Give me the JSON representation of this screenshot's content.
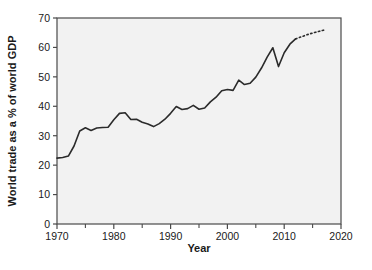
{
  "chart_data": {
    "type": "line",
    "title": "",
    "xlabel": "Year",
    "ylabel": "World trade as a % of world GDP",
    "xlim": [
      1970,
      2020
    ],
    "ylim": [
      0,
      70
    ],
    "xticks": [
      1970,
      1980,
      1990,
      2000,
      2010,
      2020
    ],
    "xtick_labels": [
      "1970",
      "1980",
      "1990",
      "2000",
      "2010",
      "2020"
    ],
    "xminor_ticks": [
      1975,
      1985,
      1995,
      2005,
      2015
    ],
    "yticks": [
      0,
      10,
      20,
      30,
      40,
      50,
      60,
      70
    ],
    "ytick_labels": [
      "0",
      "10",
      "20",
      "30",
      "40",
      "50",
      "60",
      "70"
    ],
    "grid": false,
    "legend": null,
    "line_color": "#2b2b2b",
    "plot_background": "#f2f2f2",
    "series": [
      {
        "name": "World trade as a % of world GDP",
        "style": "solid",
        "x": [
          1970,
          1971,
          1972,
          1973,
          1974,
          1975,
          1976,
          1977,
          1978,
          1979,
          1980,
          1981,
          1982,
          1983,
          1984,
          1985,
          1986,
          1987,
          1988,
          1989,
          1990,
          1991,
          1992,
          1993,
          1994,
          1995,
          1996,
          1997,
          1998,
          1999,
          2000,
          2001,
          2002,
          2003,
          2004,
          2005,
          2006,
          2007,
          2008,
          2009,
          2010,
          2011,
          2012
        ],
        "values": [
          22.4,
          22.6,
          23.1,
          26.5,
          31.6,
          32.7,
          31.8,
          32.6,
          32.8,
          32.9,
          35.4,
          37.6,
          37.8,
          35.5,
          35.6,
          34.6,
          34.0,
          33.1,
          34.1,
          35.6,
          37.6,
          39.9,
          38.9,
          39.2,
          40.3,
          39.0,
          39.4,
          41.5,
          43.1,
          45.3,
          45.7,
          45.4,
          48.9,
          47.4,
          47.8,
          49.9,
          53.0,
          56.7,
          59.9,
          53.5,
          58.2,
          61.1,
          62.9
        ],
        "annotation": "Solid historical series 1970-2012, sharp rise 1973-1975, mid-1980s dip, steady rise to 2008 peak, 2009 collapse, recovery"
      },
      {
        "name": "Projection",
        "style": "dotted",
        "x": [
          2012,
          2013,
          2014,
          2015,
          2016,
          2017
        ],
        "values": [
          62.9,
          63.6,
          64.3,
          64.9,
          65.4,
          65.9
        ],
        "annotation": "Dotted forward projection"
      }
    ]
  }
}
